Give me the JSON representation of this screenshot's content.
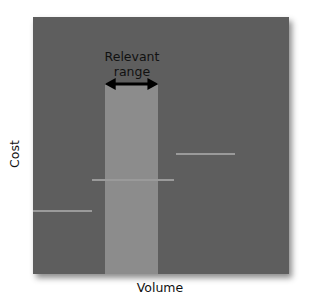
{
  "chart_data": {
    "type": "step",
    "title": "",
    "xlabel": "Volume",
    "ylabel": "Cost",
    "grid": false,
    "legend": null,
    "annotations": [
      {
        "text": "Relevant range",
        "lines": [
          "Relevant",
          "range"
        ],
        "type": "double-arrow",
        "x_range_px": [
          105,
          158
        ]
      }
    ],
    "series": [
      {
        "name": "Step fixed cost",
        "segments": [
          {
            "x_start": 0.0,
            "x_end": 0.23,
            "y": 0.25
          },
          {
            "x_start": 0.23,
            "x_end": 0.55,
            "y": 0.37
          },
          {
            "x_start": 0.56,
            "x_end": 0.79,
            "y": 0.47
          }
        ]
      }
    ],
    "relevant_range": {
      "x_start": 0.28,
      "x_end": 0.49
    },
    "colors": {
      "plot_bg": "#5e5e5e",
      "band": "#8c8c8c",
      "line": "#9a9a9a",
      "arrow": "#000000",
      "text": "#111111"
    }
  },
  "labels": {
    "range_line1": "Relevant",
    "range_line2": "range",
    "x_axis": "Volume",
    "y_axis": "Cost"
  }
}
